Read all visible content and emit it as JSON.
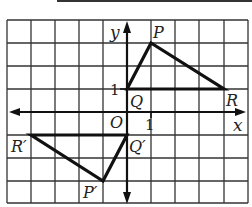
{
  "figure": {
    "type": "coordinate-grid-transformation",
    "grid": {
      "x_min": -5,
      "x_max": 5,
      "y_min": -4,
      "y_max": 4,
      "cols": 10,
      "rows": 8
    },
    "axes": {
      "x_label": "x",
      "y_label": "y",
      "origin_label": "O",
      "x_tick_label": "1",
      "y_tick_label": "1"
    },
    "triangle_original": {
      "points": [
        {
          "name": "P",
          "x": 1,
          "y": 3
        },
        {
          "name": "Q",
          "x": 0,
          "y": 1
        },
        {
          "name": "R",
          "x": 4,
          "y": 1
        }
      ]
    },
    "triangle_image": {
      "points": [
        {
          "name": "P′",
          "x": -1,
          "y": -3
        },
        {
          "name": "Q′",
          "x": 0,
          "y": -1
        },
        {
          "name": "R′",
          "x": -4,
          "y": -1
        }
      ]
    },
    "colors": {
      "grid": "#333333",
      "shape": "#111111",
      "background": "#ffffff"
    }
  }
}
